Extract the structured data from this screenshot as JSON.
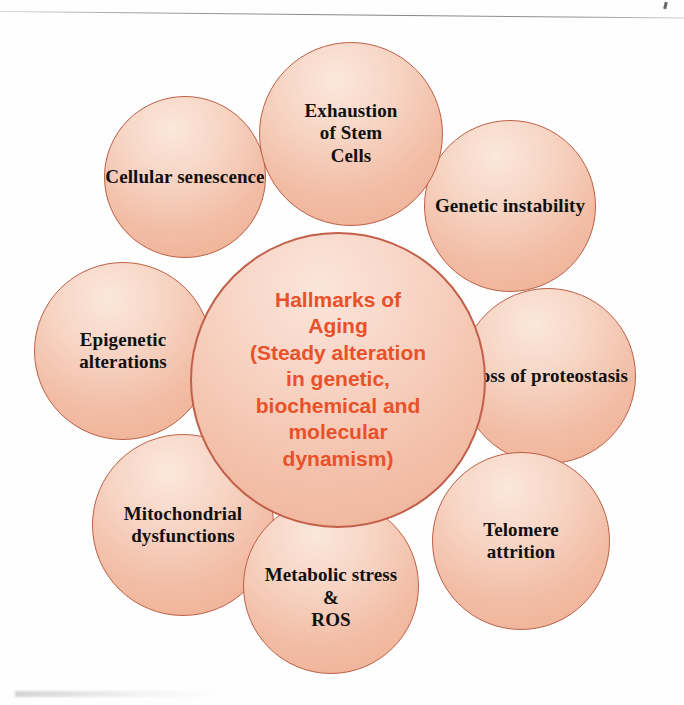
{
  "diagram": {
    "title": "Hallmarks of Aging",
    "type": "concept-bubble-diagram",
    "center": {
      "name": "hallmarks-of-aging",
      "text": "Hallmarks of\nAging\n(Steady alteration\nin genetic,\nbiochemical and\nmolecular\ndynamism)",
      "text_color": "#e8512a",
      "fill_color": "#f3bfa8",
      "border_color": "#c2604a"
    },
    "nodes": [
      {
        "id": "exhaustion-of-stem-cells",
        "label": "Exhaustion\nof Stem Cells",
        "position": "top"
      },
      {
        "id": "cellular-senescence",
        "label": "Cellular senescence",
        "position": "top-left"
      },
      {
        "id": "genetic-instability",
        "label": "Genetic instability",
        "position": "top-right"
      },
      {
        "id": "epigenetic-alterations",
        "label": "Epigenetic\nalterations",
        "position": "left"
      },
      {
        "id": "loss-of-proteostasis",
        "label": "Loss of proteostasis",
        "position": "right"
      },
      {
        "id": "mitochondrial-dysfunctions",
        "label": "Mitochondrial\ndysfunctions",
        "position": "bottom-left"
      },
      {
        "id": "telomere-attrition",
        "label": "Telomere\nattrition",
        "position": "bottom-right"
      },
      {
        "id": "metabolic-stress-ros",
        "label": "Metabolic stress\n&\nROS",
        "position": "bottom"
      }
    ],
    "palette": {
      "bubble_fill_light": "#fbe7dc",
      "bubble_fill_mid": "#f4c6b0",
      "bubble_fill_deep": "#eeaf93",
      "bubble_border": "#bd5f45",
      "node_text": "#101010",
      "center_text": "#e8512a",
      "background": "#ffffff"
    }
  }
}
